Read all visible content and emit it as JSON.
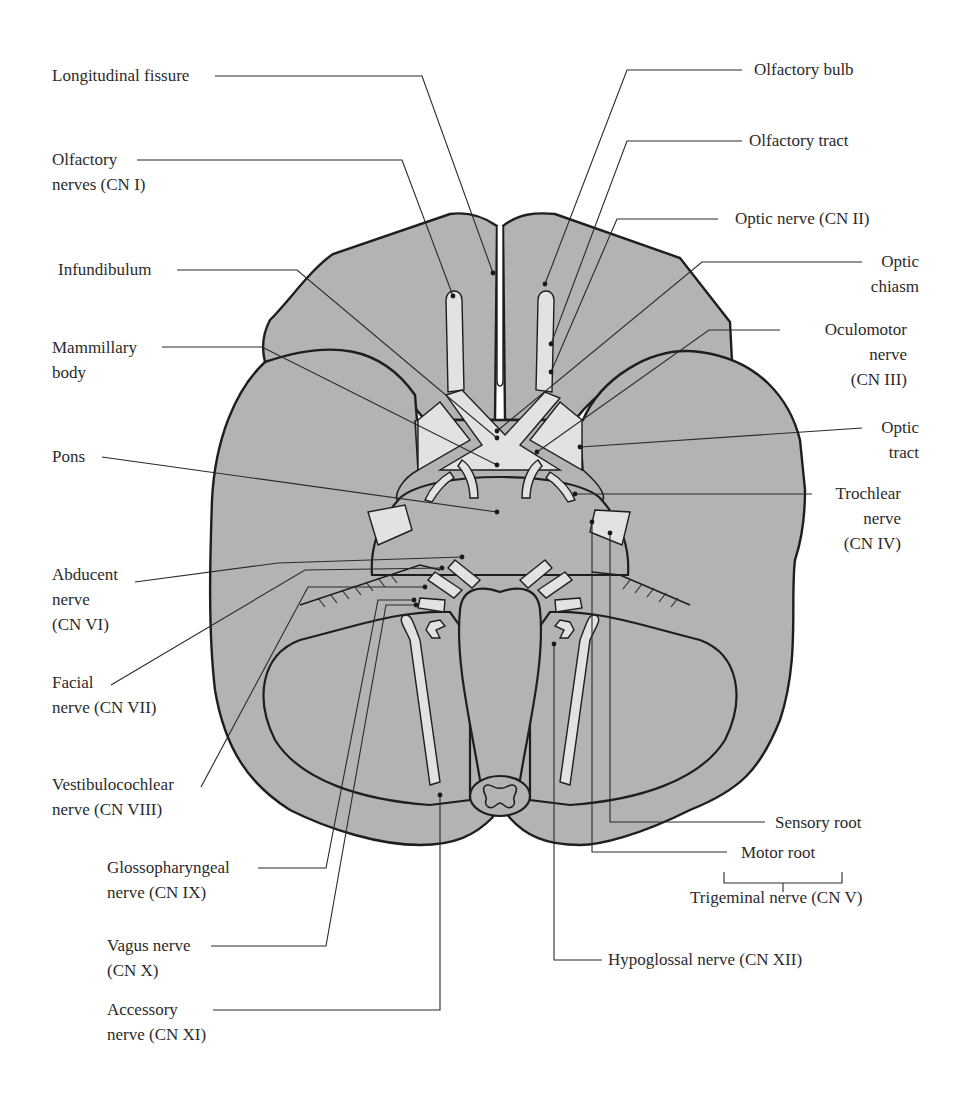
{
  "figure": {
    "colors": {
      "tissue": "#b3b3b3",
      "nerve": "#e2e2e2",
      "outline": "#1e1e1e",
      "background": "#ffffff"
    }
  },
  "labels_left": {
    "longitudinal_fissure": "Longitudinal fissure",
    "olfactory_nerves_1": "Olfactory",
    "olfactory_nerves_2": "nerves (CN I)",
    "infundibulum": "Infundibulum",
    "mammillary_body_1": "Mammillary",
    "mammillary_body_2": "body",
    "pons": "Pons",
    "abducent_1": "Abducent",
    "abducent_2": "nerve",
    "abducent_3": "(CN VI)",
    "facial_1": "Facial",
    "facial_2": "nerve (CN VII)",
    "vestibulocochlear_1": "Vestibulocochlear",
    "vestibulocochlear_2": "nerve (CN VIII)",
    "glossopharyngeal_1": "Glossopharyngeal",
    "glossopharyngeal_2": "nerve (CN IX)",
    "vagus_1": "Vagus nerve",
    "vagus_2": "(CN X)",
    "accessory_1": "Accessory",
    "accessory_2": "nerve (CN XI)"
  },
  "labels_right": {
    "olfactory_bulb": "Olfactory bulb",
    "olfactory_tract": "Olfactory tract",
    "optic_nerve": "Optic nerve (CN II)",
    "optic_chiasm_1": "Optic",
    "optic_chiasm_2": "chiasm",
    "oculomotor_1": "Oculomotor",
    "oculomotor_2": "nerve",
    "oculomotor_3": "(CN III)",
    "optic_tract_1": "Optic",
    "optic_tract_2": "tract",
    "trochlear_1": "Trochlear",
    "trochlear_2": "nerve",
    "trochlear_3": "(CN IV)",
    "sensory_root": "Sensory root",
    "motor_root": "Motor root",
    "trigeminal": "Trigeminal nerve (CN V)",
    "hypoglossal": "Hypoglossal nerve (CN XII)"
  }
}
